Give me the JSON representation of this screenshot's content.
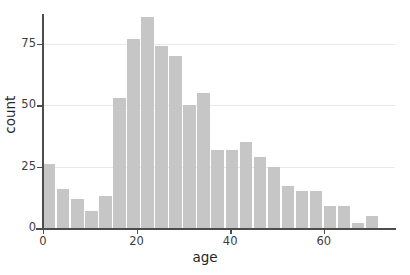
{
  "chart_data": {
    "type": "bar",
    "title": "",
    "subtitle": "",
    "xlabel": "age",
    "ylabel": "count",
    "xlim": [
      0,
      75
    ],
    "ylim": [
      0,
      88
    ],
    "xticks": [
      0,
      20,
      40,
      60
    ],
    "yticks": [
      0,
      25,
      50,
      75
    ],
    "grid": true,
    "legend": null,
    "bin_width": 3,
    "bin_starts": [
      0,
      3,
      6,
      9,
      12,
      15,
      18,
      21,
      24,
      27,
      30,
      33,
      36,
      39,
      42,
      45,
      48,
      51,
      54,
      57,
      60,
      63,
      66,
      69
    ],
    "categories": [
      "0-3",
      "3-6",
      "6-9",
      "9-12",
      "12-15",
      "15-18",
      "18-21",
      "21-24",
      "24-27",
      "27-30",
      "30-33",
      "33-36",
      "36-39",
      "39-42",
      "42-45",
      "45-48",
      "48-51",
      "51-54",
      "54-57",
      "57-60",
      "60-63",
      "63-66",
      "66-69",
      "69-72"
    ],
    "values": [
      26,
      16,
      12,
      7,
      13,
      53,
      77,
      86,
      74,
      70,
      50,
      55,
      32,
      32,
      35,
      29,
      25,
      17,
      15,
      15,
      9,
      9,
      2,
      5
    ],
    "bar_color": "#c6c6c6",
    "axis_color": "#4d4d4d",
    "grid_color": "#e8e8e8",
    "background_color": "#ffffff"
  },
  "axes": {
    "x_title": "age",
    "y_title": "count",
    "x_tick_labels": [
      "0",
      "20",
      "40",
      "60"
    ],
    "y_tick_labels": [
      "0",
      "25",
      "50",
      "75"
    ]
  }
}
